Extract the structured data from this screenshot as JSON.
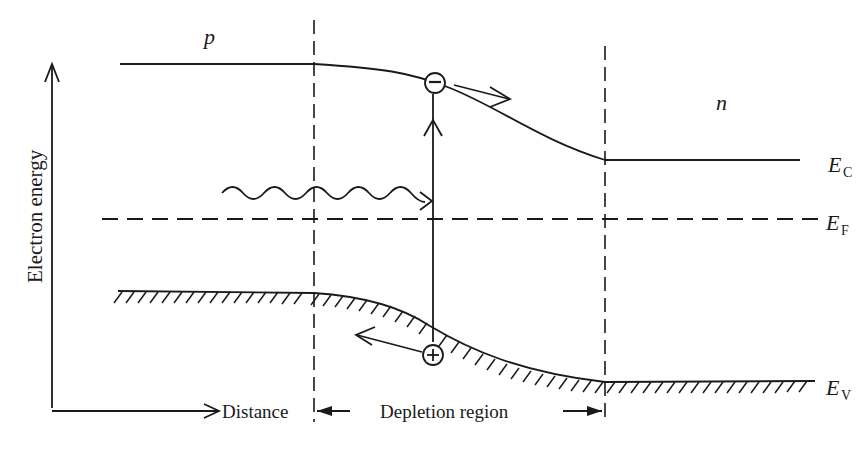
{
  "diagram": {
    "axes": {
      "y_label": "Electron energy",
      "x_label": "Distance"
    },
    "regions": {
      "p_label": "p",
      "n_label": "n",
      "depletion_label": "Depletion region"
    },
    "levels": {
      "conduction": {
        "symbol": "E",
        "subscript": "C"
      },
      "fermi": {
        "symbol": "E",
        "subscript": "F"
      },
      "valence": {
        "symbol": "E",
        "subscript": "V"
      }
    },
    "carriers": {
      "electron_symbol": "−",
      "hole_symbol": "+"
    },
    "photon": "incident photon (wavy arrow)",
    "colors": {
      "ink": "#1a1a1a",
      "background": "#ffffff"
    }
  }
}
